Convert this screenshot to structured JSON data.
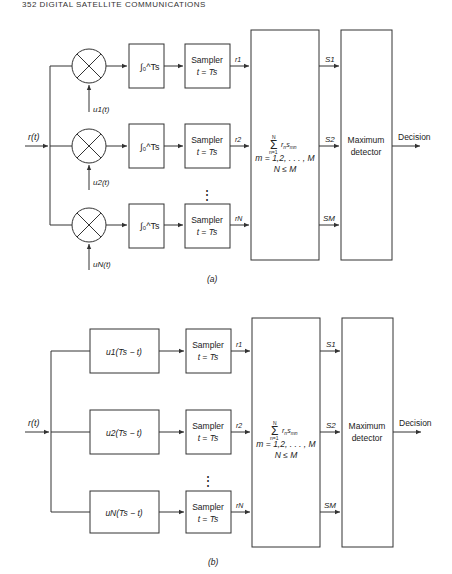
{
  "header": {
    "text": "352 DIGITAL SATELLITE COMMUNICATIONS"
  },
  "diagram_a": {
    "caption": "(a)",
    "input_label": "r(t)",
    "branches": [
      {
        "basis_label": "u1(t)",
        "integrator_label": "∫₀^Ts",
        "sampler_line1": "Sampler",
        "sampler_line2": "t = Ts",
        "output": "r1"
      },
      {
        "basis_label": "u2(t)",
        "integrator_label": "∫₀^Ts",
        "sampler_line1": "Sampler",
        "sampler_line2": "t = Ts",
        "output": "r2"
      },
      {
        "basis_label": "uN(t)",
        "integrator_label": "∫₀^Ts",
        "sampler_line1": "Sampler",
        "sampler_line2": "t = Ts",
        "output": "rN"
      }
    ],
    "combiner": {
      "sum_expr": "Σ rn smn",
      "sum_limits_top": "N",
      "sum_limits_bottom": "n=1",
      "line2": "m = 1,2, . . . , M",
      "line3": "N ≤ M"
    },
    "combiner_outputs": [
      "S1",
      "S2",
      "SM"
    ],
    "detector": {
      "line1": "Maximum",
      "line2": "detector"
    },
    "output_label": "Decision"
  },
  "diagram_b": {
    "caption": "(b)",
    "input_label": "r(t)",
    "branches": [
      {
        "filter_label": "u1(Ts − t)",
        "sampler_line1": "Sampler",
        "sampler_line2": "t = Ts",
        "output": "r1"
      },
      {
        "filter_label": "u2(Ts − t)",
        "sampler_line1": "Sampler",
        "sampler_line2": "t = Ts",
        "output": "r2"
      },
      {
        "filter_label": "uN(Ts − t)",
        "sampler_line1": "Sampler",
        "sampler_line2": "t = Ts",
        "output": "rN"
      }
    ],
    "combiner": {
      "sum_expr": "Σ rn smn",
      "sum_limits_top": "N",
      "sum_limits_bottom": "n=1",
      "line2": "m = 1,2, . . . , M",
      "line3": "N ≤ M"
    },
    "combiner_outputs": [
      "S1",
      "S2",
      "SM"
    ],
    "detector": {
      "line1": "Maximum",
      "line2": "detector"
    },
    "output_label": "Decision"
  },
  "ellipsis": "⋮"
}
